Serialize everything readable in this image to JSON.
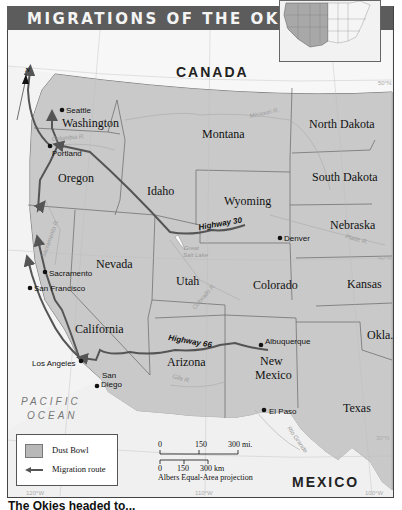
{
  "header": {
    "title": "MIGRATIONS OF THE OKIES"
  },
  "map": {
    "countries": {
      "north": "CANADA",
      "south": "MEXICO"
    },
    "ocean": {
      "line1": "PACIFIC",
      "line2": "OCEAN"
    },
    "north_arrow": "N",
    "states": {
      "washington": "Washington",
      "oregon": "Oregon",
      "california": "California",
      "nevada": "Nevada",
      "idaho": "Idaho",
      "montana": "Montana",
      "wyoming": "Wyoming",
      "utah": "Utah",
      "colorado": "Colorado",
      "arizona": "Arizona",
      "new_mexico_1": "New",
      "new_mexico_2": "Mexico",
      "north_dakota": "North Dakota",
      "south_dakota": "South Dakota",
      "nebraska": "Nebraska",
      "kansas": "Kansas",
      "oklahoma": "Okla.",
      "texas": "Texas"
    },
    "cities": {
      "seattle": "Seattle",
      "portland": "Portland",
      "sacramento": "Sacramento",
      "san_francisco": "San Francisco",
      "los_angeles": "Los Angeles",
      "san_diego_1": "San",
      "san_diego_2": "Diego",
      "denver": "Denver",
      "albuquerque": "Albuquerque",
      "el_paso": "El Paso"
    },
    "rivers": {
      "columbia": "Columbia R.",
      "missouri": "Missouri R.",
      "sacramento": "Sacramento R.",
      "colorado": "Colorado R.",
      "platte": "Platte R.",
      "gila": "Gila R.",
      "rio_grande": "Rio Grande"
    },
    "lakes": {
      "great_salt_1": "Great",
      "great_salt_2": "Salt Lake"
    },
    "highways": {
      "hwy30": "Highway  30",
      "hwy66": "Highway  66"
    },
    "grid": {
      "lat50": "50°N",
      "lat40": "40°N",
      "lat30": "30°N",
      "lon120": "120°W",
      "lon110": "110°W",
      "lon100": "100°W"
    },
    "colors": {
      "dust_bowl": "#bdbdbd",
      "land": "#e6e6e6",
      "route": "#555555",
      "title_bar": "#5c5c5c"
    }
  },
  "legend": {
    "dust_bowl": "Dust Bowl",
    "migration_route": "Migration route"
  },
  "scale": {
    "mi_0": "0",
    "mi_150": "150",
    "mi_300": "300 mi.",
    "km_0": "0",
    "km_150": "150",
    "km_300": "300 km",
    "projection": "Albers Equal-Area projection"
  },
  "caption": "The Okies headed to..."
}
